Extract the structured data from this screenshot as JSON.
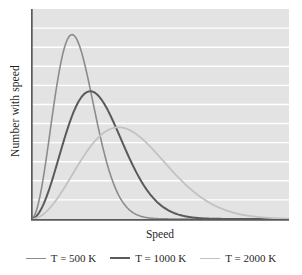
{
  "figure": {
    "background": "#ffffff",
    "plot_background": "#e3e3e3",
    "gridline_color": "#ffffff",
    "axis_color": "#5a5a5a"
  },
  "axes": {
    "xlabel": "Speed",
    "ylabel": "Number with speed"
  },
  "legend": {
    "items": [
      {
        "label": "T = 500 K",
        "color": "#8c8c8c",
        "width": 1.6
      },
      {
        "label": "T = 1000 K",
        "color": "#5a5a5a",
        "width": 2.0
      },
      {
        "label": "T = 2000 K",
        "color": "#c2c2c2",
        "width": 1.8
      }
    ]
  },
  "chart_data": {
    "type": "line",
    "title": "",
    "xlabel": "Speed",
    "ylabel": "Number with speed",
    "grid": true,
    "gridlines_horizontal": 10,
    "legend_position": "below",
    "xlim": [
      0,
      1
    ],
    "ylim": [
      0,
      1
    ],
    "x_ticks": [],
    "y_ticks": [],
    "series": [
      {
        "name": "T = 500 K",
        "color": "#8c8c8c",
        "peak_x": 0.225,
        "peak_y": 0.895,
        "a": 0.159,
        "x": [
          0.0,
          0.05,
          0.1,
          0.15,
          0.2,
          0.225,
          0.25,
          0.3,
          0.35,
          0.4,
          0.45,
          0.5,
          0.55,
          0.6,
          0.65,
          0.7,
          0.8,
          0.9,
          1.0
        ],
        "y": [
          0.0,
          0.084,
          0.297,
          0.574,
          0.818,
          0.895,
          0.93,
          0.894,
          0.758,
          0.578,
          0.397,
          0.247,
          0.139,
          0.071,
          0.033,
          0.014,
          0.002,
          0.0,
          0.0
        ]
      },
      {
        "name": "T = 1000 K",
        "color": "#5a5a5a",
        "peak_x": 0.325,
        "peak_y": 0.62,
        "a": 0.2298,
        "x": [
          0.0,
          0.05,
          0.1,
          0.15,
          0.2,
          0.25,
          0.3,
          0.325,
          0.35,
          0.4,
          0.45,
          0.5,
          0.55,
          0.6,
          0.65,
          0.7,
          0.8,
          0.9,
          1.0
        ],
        "y": [
          0.0,
          0.029,
          0.108,
          0.223,
          0.358,
          0.479,
          0.58,
          0.62,
          0.617,
          0.588,
          0.505,
          0.406,
          0.306,
          0.216,
          0.143,
          0.09,
          0.03,
          0.008,
          0.002
        ]
      },
      {
        "name": "T = 2000 K",
        "color": "#c2c2c2",
        "peak_x": 0.48,
        "peak_y": 0.445,
        "a": 0.3394,
        "x": [
          0.0,
          0.05,
          0.1,
          0.15,
          0.2,
          0.25,
          0.3,
          0.35,
          0.4,
          0.45,
          0.48,
          0.5,
          0.55,
          0.6,
          0.65,
          0.7,
          0.8,
          0.9,
          1.0
        ],
        "y": [
          0.0,
          0.01,
          0.038,
          0.081,
          0.136,
          0.197,
          0.259,
          0.317,
          0.366,
          0.402,
          0.444,
          0.424,
          0.427,
          0.413,
          0.388,
          0.354,
          0.271,
          0.188,
          0.121
        ]
      }
    ]
  }
}
